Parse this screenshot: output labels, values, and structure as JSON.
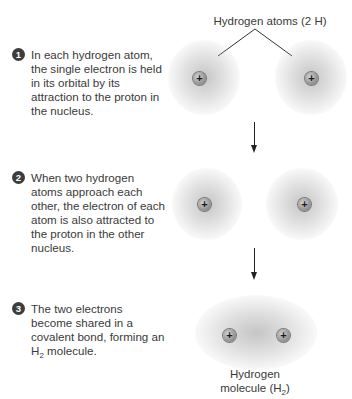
{
  "title_label": "Hydrogen atoms (2 H)",
  "steps": [
    {
      "number": "1",
      "text": "In each hydrogen atom, the single electron is held in its orbital by its attraction to the proton in the nucleus."
    },
    {
      "number": "2",
      "text": "When two hydrogen atoms approach each other, the electron of each atom is also attracted to the proton in the other nucleus."
    },
    {
      "number": "3",
      "text_before": "The two electrons become shared in a covalent bond, forming an H",
      "subscript": "2",
      "text_after": " molecule."
    }
  ],
  "molecule_label": {
    "line1": "Hydrogen",
    "line2_before": "molecule (H",
    "subscript": "2",
    "line2_after": ")"
  },
  "proton_symbol": "+",
  "colors": {
    "text": "#3a3a3a",
    "badge": "#3d3d3d",
    "proton": "#9a9a9a",
    "arrow": "#222222"
  }
}
